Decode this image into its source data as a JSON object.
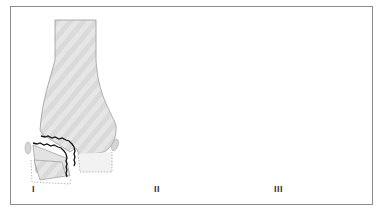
{
  "figure": {
    "panels": [
      {
        "label": "I",
        "type": "unicondylar-fracture-lateral"
      },
      {
        "label": "II",
        "type": "unicondylar-fracture-oblique"
      },
      {
        "label": "III",
        "type": "bicondylar-y-fracture"
      }
    ],
    "colors": {
      "frame": "#8c8c8c",
      "bone_fill": "#dcdcdc",
      "bone_stroke": "#9a9a9a",
      "fragment_fill_light": "#f2f2f2",
      "fracture_line": "#111111",
      "dotted_outline": "#a8a8a8",
      "label": "#333333"
    }
  }
}
